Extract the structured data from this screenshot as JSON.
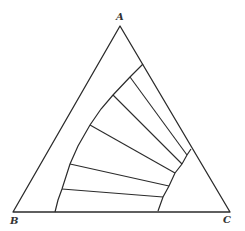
{
  "diagram": {
    "type": "ternary-phase-diagram",
    "vertices": [
      {
        "label": "A",
        "x": 120,
        "y": 26,
        "label_x": 116,
        "label_y": 20
      },
      {
        "label": "B",
        "x": 13,
        "y": 212,
        "label_x": 10,
        "label_y": 224
      },
      {
        "label": "C",
        "x": 230,
        "y": 212,
        "label_x": 223,
        "label_y": 223
      }
    ],
    "binodal_left": [
      [
        55,
        212
      ],
      [
        58,
        200
      ],
      [
        62,
        189
      ],
      [
        70,
        164
      ],
      [
        78,
        146
      ],
      [
        90,
        125
      ],
      [
        101,
        109
      ],
      [
        113,
        95
      ],
      [
        130,
        77
      ],
      [
        143,
        64
      ]
    ],
    "binodal_right": [
      [
        191,
        149
      ],
      [
        187,
        155
      ],
      [
        182,
        164
      ],
      [
        175,
        173
      ],
      [
        169,
        186
      ],
      [
        163,
        197
      ],
      [
        158,
        211
      ]
    ],
    "tie_lines": [
      {
        "from": [
          130,
          77
        ],
        "to": [
          187,
          155
        ]
      },
      {
        "from": [
          113,
          95
        ],
        "to": [
          182,
          164
        ]
      },
      {
        "from": [
          90,
          125
        ],
        "to": [
          175,
          173
        ]
      },
      {
        "from": [
          70,
          164
        ],
        "to": [
          169,
          186
        ]
      },
      {
        "from": [
          62,
          189
        ],
        "to": [
          163,
          197
        ]
      }
    ],
    "stroke_color": "#2b2b2b",
    "background": "#ffffff"
  }
}
